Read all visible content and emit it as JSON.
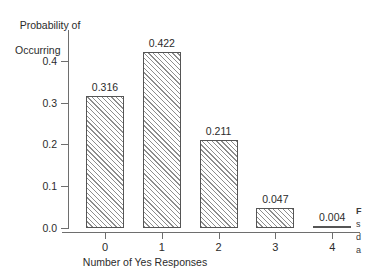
{
  "chart_data": {
    "type": "bar",
    "title": "",
    "xlabel": "Number of Yes Responses",
    "ylabel": "Probability of Occurring",
    "ylabel_line1": "Probability of",
    "ylabel_line2": "Occurring",
    "categories": [
      "0",
      "1",
      "2",
      "3",
      "4"
    ],
    "values": [
      0.316,
      0.422,
      0.211,
      0.047,
      0.004
    ],
    "value_labels": [
      "0.316",
      "0.422",
      "0.211",
      "0.047",
      "0.004"
    ],
    "ylim": [
      0.0,
      0.45
    ],
    "yticks": [
      0.0,
      0.1,
      0.2,
      0.3,
      0.4
    ],
    "ytick_labels": [
      "0.0",
      "0.1",
      "0.2",
      "0.3",
      "0.4"
    ],
    "xtick_labels": [
      "0",
      "1",
      "2",
      "3",
      "4"
    ],
    "grid": false,
    "legend": false,
    "bar_fill": "hatched-diagonal",
    "bar_edge_color": "#555555",
    "bar_hatch_color": "#8d8d8d",
    "axis_color": "#6e6e6e",
    "background": "#ffffff"
  },
  "caption": {
    "head": "F",
    "line2": "s",
    "line3": "d",
    "line4": "a"
  }
}
